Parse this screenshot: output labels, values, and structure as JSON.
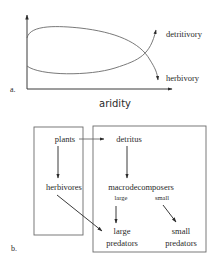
{
  "panel_a": {
    "label": "a.",
    "x_axis_label": "aridity",
    "curves": [
      {
        "name": "detritivory",
        "label": "detritivory",
        "trend": "increasing with aridity"
      },
      {
        "name": "herbivory",
        "label": "herbivory",
        "trend": "decreasing with aridity"
      }
    ]
  },
  "panel_b": {
    "label": "b.",
    "nodes": {
      "plants": "plants",
      "herbivores": "herbivores",
      "detritus": "detritus",
      "macrodecomposers": "macrodecomposers",
      "large": "large",
      "small": "small",
      "large_predators_1": "large",
      "large_predators_2": "predators",
      "small_predators_1": "small",
      "small_predators_2": "predators"
    },
    "edges": [
      {
        "from": "plants",
        "to": "detritus"
      },
      {
        "from": "plants",
        "to": "herbivores"
      },
      {
        "from": "detritus",
        "to": "macrodecomposers"
      },
      {
        "from": "herbivores",
        "to": "large predators"
      },
      {
        "from": "large macrodecomposers",
        "to": "large predators"
      },
      {
        "from": "small macrodecomposers",
        "to": "small predators"
      }
    ]
  }
}
